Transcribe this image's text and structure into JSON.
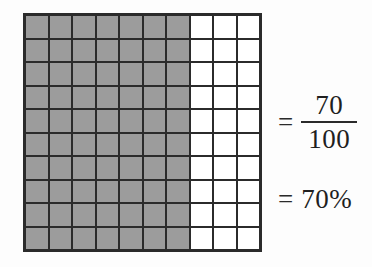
{
  "figure": {
    "grid": {
      "rows": 10,
      "columns": 10,
      "total_cells": 100,
      "shaded_cells": 70,
      "shaded_columns": 7,
      "unshaded_columns": 3,
      "shaded_color": "#9c9c9c",
      "unshaded_color": "#ffffff",
      "line_color": "#2b2b2b"
    },
    "expression": {
      "equals_sign_1": "=",
      "numerator": "70",
      "denominator": "100",
      "equals_sign_2": "=",
      "percent": "70%"
    }
  },
  "chart_data": {
    "type": "bar",
    "categories": [
      "shaded",
      "unshaded"
    ],
    "values": [
      70,
      30
    ],
    "xlabel": "",
    "ylabel": "cells out of 100",
    "ylim": [
      0,
      100
    ]
  }
}
